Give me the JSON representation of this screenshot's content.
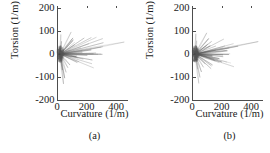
{
  "figure": {
    "panels": [
      {
        "id": "a",
        "caption": "(a)",
        "xlabel": "Curvature (1/m)",
        "ylabel": "Torsion (1/m)"
      },
      {
        "id": "b",
        "caption": "(b)",
        "xlabel": "Curvature (1/m)",
        "ylabel": "Torsion (1/m)"
      }
    ],
    "colors": {
      "axis": "#4d4d4d",
      "data": "#555555",
      "background": "#ffffff"
    }
  },
  "chart_data": [
    {
      "type": "line",
      "panel": "(a)",
      "title": "",
      "xlabel": "Curvature (1/m)",
      "ylabel": "Torsion (1/m)",
      "xlim": [
        0,
        480
      ],
      "ylim": [
        -200,
        200
      ],
      "xticks": [
        0,
        200,
        400
      ],
      "xtick_labels": [
        "0",
        "200",
        "400"
      ],
      "yticks": [
        200,
        100,
        0,
        -100,
        -200
      ],
      "ytick_labels": [
        "200",
        "100",
        "0",
        "-100",
        "-200"
      ],
      "grid": false,
      "legend": "none",
      "description": "Dense spiky burst of curvature-torsion trajectory concentrated near the origin with radial spikes extending mainly toward positive curvature",
      "spikes": [
        {
          "x": 455,
          "y": 52
        },
        {
          "x": 300,
          "y": 30
        },
        {
          "x": 232,
          "y": 18
        },
        {
          "x": 205,
          "y": -6
        },
        {
          "x": 178,
          "y": -22
        },
        {
          "x": 150,
          "y": -34
        },
        {
          "x": 132,
          "y": -12
        },
        {
          "x": 120,
          "y": 40
        },
        {
          "x": 108,
          "y": 70
        },
        {
          "x": 96,
          "y": 96
        },
        {
          "x": 88,
          "y": -48
        },
        {
          "x": 74,
          "y": -60
        },
        {
          "x": 62,
          "y": -80
        },
        {
          "x": 52,
          "y": -105
        },
        {
          "x": 44,
          "y": -130
        },
        {
          "x": 36,
          "y": -70
        },
        {
          "x": 30,
          "y": 55
        },
        {
          "x": 26,
          "y": 85
        },
        {
          "x": 20,
          "y": -30
        },
        {
          "x": 14,
          "y": 20
        }
      ],
      "core": {
        "x": 22,
        "y": 0,
        "radius_x": 26,
        "radius_y": 38
      }
    },
    {
      "type": "line",
      "panel": "(b)",
      "title": "",
      "xlabel": "Curvature (1/m)",
      "ylabel": "Torsion (1/m)",
      "xlim": [
        0,
        480
      ],
      "ylim": [
        -200,
        200
      ],
      "xticks": [
        0,
        200,
        400
      ],
      "xtick_labels": [
        "0",
        "200",
        "400"
      ],
      "yticks": [
        200,
        100,
        0,
        -100,
        -200
      ],
      "ytick_labels": [
        "200",
        "100",
        "0",
        "-100",
        "-200"
      ],
      "grid": false,
      "legend": "none",
      "description": "Dense spiky burst of curvature-torsion trajectory concentrated near the origin with radial spikes extending mainly toward positive curvature",
      "spikes": [
        {
          "x": 448,
          "y": 54
        },
        {
          "x": 312,
          "y": 34
        },
        {
          "x": 240,
          "y": 14
        },
        {
          "x": 210,
          "y": -4
        },
        {
          "x": 185,
          "y": -20
        },
        {
          "x": 158,
          "y": -30
        },
        {
          "x": 138,
          "y": -10
        },
        {
          "x": 124,
          "y": 36
        },
        {
          "x": 112,
          "y": 66
        },
        {
          "x": 100,
          "y": 92
        },
        {
          "x": 90,
          "y": -44
        },
        {
          "x": 78,
          "y": -58
        },
        {
          "x": 64,
          "y": -78
        },
        {
          "x": 54,
          "y": -102
        },
        {
          "x": 46,
          "y": -128
        },
        {
          "x": 38,
          "y": -66
        },
        {
          "x": 32,
          "y": 58
        },
        {
          "x": 26,
          "y": 88
        },
        {
          "x": 20,
          "y": -28
        },
        {
          "x": 14,
          "y": 22
        }
      ],
      "core": {
        "x": 22,
        "y": 0,
        "radius_x": 26,
        "radius_y": 38
      }
    }
  ]
}
